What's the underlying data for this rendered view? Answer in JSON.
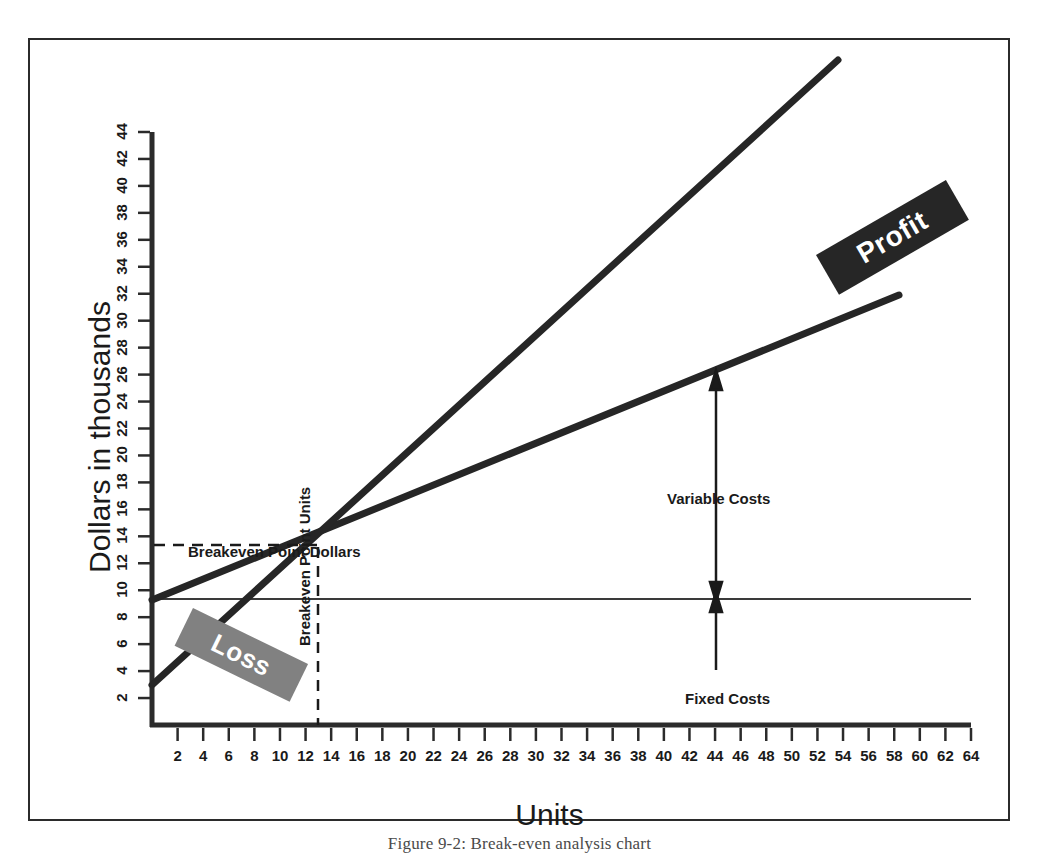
{
  "figure": {
    "caption": "Figure 9-2: Break-even analysis chart"
  },
  "chart_data": {
    "type": "line",
    "title": "",
    "xlabel": "Units",
    "ylabel": "Dollars in thousands",
    "xlim": [
      0,
      64
    ],
    "ylim": [
      0,
      44
    ],
    "grid": false,
    "legend_position": "none",
    "x_ticks": [
      2,
      4,
      6,
      8,
      10,
      12,
      14,
      16,
      18,
      20,
      22,
      24,
      26,
      28,
      30,
      32,
      34,
      36,
      38,
      40,
      42,
      44,
      46,
      48,
      50,
      52,
      54,
      56,
      58,
      60,
      62,
      64
    ],
    "y_ticks": [
      2,
      4,
      6,
      8,
      10,
      12,
      14,
      16,
      18,
      20,
      22,
      24,
      26,
      28,
      30,
      32,
      34,
      36,
      38,
      40,
      42,
      44
    ],
    "series": [
      {
        "name": "Total Revenue",
        "style": "thick-solid",
        "points": [
          [
            0.6,
            4.0
          ],
          [
            52.0,
            46.0
          ]
        ]
      },
      {
        "name": "Total Costs",
        "style": "thick-solid",
        "points": [
          [
            0.6,
            10.1
          ],
          [
            58.0,
            31.5
          ]
        ]
      },
      {
        "name": "Fixed Costs",
        "style": "thin-solid",
        "points": [
          [
            0.6,
            10.1
          ],
          [
            64.0,
            10.1
          ]
        ]
      }
    ],
    "breakeven": {
      "units": 13.0,
      "dollars": 14.7,
      "dollars_guide": "dashed-horizontal",
      "units_guide": "dashed-vertical"
    },
    "annotations": [
      {
        "name": "breakeven-point-dollars",
        "text": "Breakeven Point Dollars",
        "orientation": "horizontal"
      },
      {
        "name": "breakeven-point-units",
        "text": "Breakeven Point Units",
        "orientation": "vertical"
      },
      {
        "name": "loss-region",
        "text": "Loss",
        "style": "white-on-gray-rotated",
        "color": "#818181"
      },
      {
        "name": "profit-region",
        "text": "Profit",
        "style": "white-on-black-rotated",
        "color": "#262626"
      },
      {
        "name": "variable-costs",
        "text": "Variable Costs",
        "arrow": "double-vertical",
        "at_units": 42
      },
      {
        "name": "fixed-costs",
        "text": "Fixed Costs",
        "arrow": "up-vertical",
        "at_units": 42
      }
    ]
  },
  "colors": {
    "line": "#262626",
    "frame": "#2b2b2b",
    "loss_box": "#818181",
    "profit_box": "#262626",
    "text": "#1a1a1a",
    "background": "#ffffff"
  }
}
